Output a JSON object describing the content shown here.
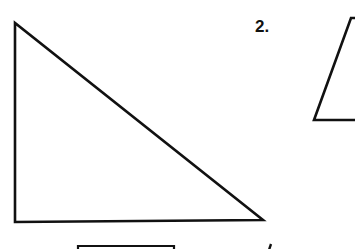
{
  "worksheet": {
    "problems": [
      {
        "label": "",
        "shape": "right-triangle",
        "vertices": [
          [
            15,
            23
          ],
          [
            15,
            222
          ],
          [
            263,
            220
          ]
        ]
      },
      {
        "label": "2.",
        "shape": "trapezoid-partial",
        "vertices": [
          [
            351,
            18
          ],
          [
            314,
            120
          ],
          [
            355,
            120
          ]
        ]
      },
      {
        "label": "",
        "shape": "rectangle-partial",
        "top_edge": [
          [
            78,
            246
          ],
          [
            174,
            246
          ]
        ]
      },
      {
        "label": "",
        "shape": "partial-mark",
        "point": [
          270,
          246
        ]
      }
    ],
    "colors": {
      "stroke": "#111111",
      "background": "#ffffff"
    }
  }
}
